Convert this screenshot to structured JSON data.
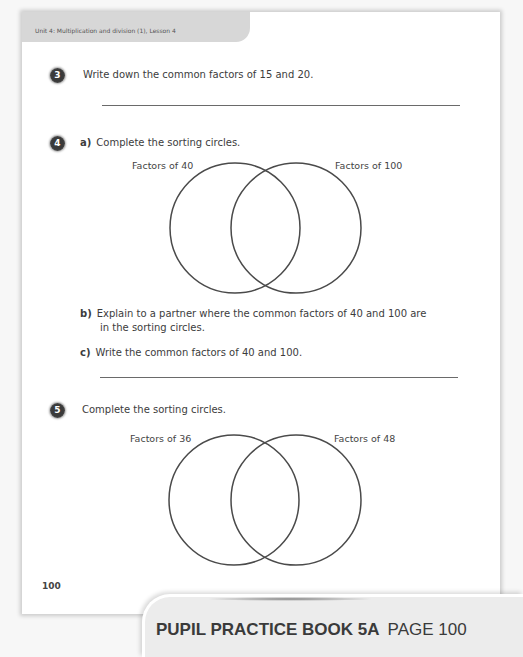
{
  "header": {
    "unit_label": "Unit 4: Multiplication and division (1), Lesson 4"
  },
  "questions": [
    {
      "number": "3",
      "text": "Write down the common factors of 15 and 20."
    },
    {
      "number": "4",
      "parts": [
        {
          "label": "a)",
          "text": "Complete the sorting circles."
        },
        {
          "label": "b)",
          "text_line1": "Explain to a partner where the common factors of 40 and 100 are",
          "text_line2": "in the sorting circles."
        },
        {
          "label": "c)",
          "text": "Write the common factors of 40 and 100."
        }
      ],
      "venn": {
        "left_label": "Factors of 40",
        "right_label": "Factors of 100"
      }
    },
    {
      "number": "5",
      "text": "Complete the sorting circles.",
      "venn": {
        "left_label": "Factors of 36",
        "right_label": "Factors of 48"
      }
    }
  ],
  "page_number": "100",
  "footer": {
    "book_title": "PUPIL PRACTICE BOOK 5A",
    "page_label": "PAGE 100"
  }
}
